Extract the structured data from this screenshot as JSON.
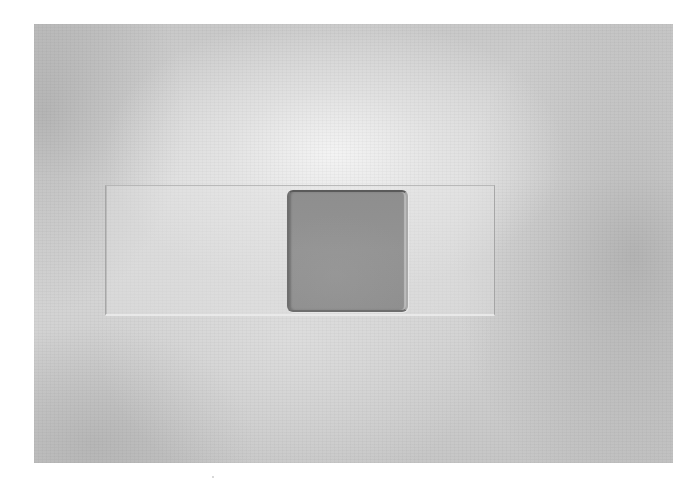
{
  "image": {
    "description": "Grayscale photograph of a glass microscope slide with a square gray film/coverslip placed on it, on a mottled light-gray background",
    "background_color": "#ffffff",
    "photo_tone": "grayscale",
    "colors": {
      "background_light": "#dcdcdc",
      "background_dark": "#b4b4b4",
      "slide_edge": "#969696",
      "coverslip_fill": "#8e8e8e",
      "coverslip_border": "#6e6e6e"
    }
  }
}
